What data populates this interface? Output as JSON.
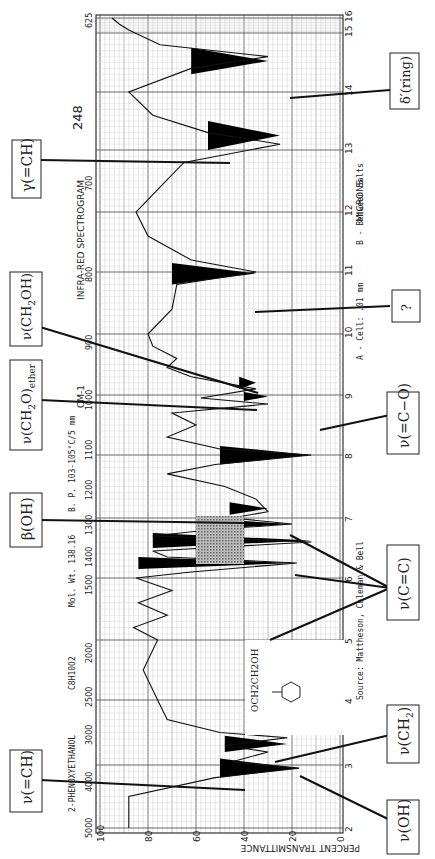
{
  "chart_data": {
    "type": "line",
    "title": "INFRA-RED SPECTROGRAM",
    "page_number": "248",
    "compound": "2-PHENOXYETHANOL",
    "formula": "C8H10O2",
    "mol_wt": "Mol. Wt. 138.16",
    "bp": "B. P. 103-105°C/5 mm",
    "cell": "A - Cell: .01 mm",
    "cell_b": "B - Between Salts",
    "source": "Source: Mattheson, Coleman & Bell",
    "structure_label": "OCH2CH2OH",
    "xlabel_top": "CM-1",
    "xlabel_bottom": "MICRONS",
    "ylabel": "PERCENT TRANSMITTANCE",
    "orientation": "rotated 90° counter-clockwise",
    "wavenumber_ticks": [
      "5000",
      "4000",
      "3000",
      "2500",
      "2000",
      "1500",
      "1400",
      "1300",
      "1200",
      "1100",
      "1000",
      "900",
      "800",
      "700",
      "625"
    ],
    "micron_ticks": [
      "2",
      "3",
      "4",
      "5",
      "6",
      "7",
      "8",
      "9",
      "10",
      "11",
      "12",
      "13",
      "14",
      "15",
      "16"
    ],
    "transmittance_ticks": [
      "100",
      "80",
      "60",
      "40",
      "20",
      "0"
    ],
    "ylim": [
      0,
      100
    ],
    "xlim_cm1": [
      5000,
      625
    ],
    "series": [
      {
        "name": "2-phenoxyethanol spectrum",
        "x_micron": [
          2.0,
          2.5,
          2.8,
          2.95,
          3.05,
          3.2,
          3.3,
          3.42,
          3.5,
          3.7,
          4.0,
          4.5,
          5.0,
          5.2,
          5.4,
          5.6,
          5.8,
          6.0,
          6.1,
          6.25,
          6.35,
          6.45,
          6.6,
          6.7,
          6.8,
          6.9,
          7.0,
          7.1,
          7.3,
          7.5,
          7.7,
          7.85,
          8.0,
          8.1,
          8.3,
          8.5,
          8.7,
          8.85,
          8.95,
          9.1,
          9.3,
          9.45,
          9.6,
          9.8,
          10.0,
          10.4,
          10.8,
          11.0,
          11.2,
          11.6,
          12.0,
          12.4,
          12.8,
          13.1,
          13.3,
          13.6,
          14.0,
          14.4,
          14.6,
          14.8,
          15.2,
          15.6,
          16.0
        ],
        "transmittance": [
          88,
          88,
          52,
          17,
          45,
          30,
          48,
          22,
          50,
          72,
          76,
          82,
          76,
          86,
          72,
          84,
          70,
          85,
          62,
          18,
          72,
          78,
          12,
          78,
          55,
          20,
          45,
          30,
          35,
          48,
          72,
          52,
          12,
          50,
          72,
          60,
          70,
          30,
          58,
          35,
          62,
          72,
          68,
          78,
          80,
          70,
          68,
          35,
          62,
          80,
          85,
          75,
          65,
          25,
          55,
          78,
          88,
          62,
          30,
          75,
          88,
          92,
          95
        ]
      }
    ],
    "annotations": [
      {
        "label": "ν(OH)",
        "wavenumber": 3330,
        "micron": 3.0
      },
      {
        "label": "ν(=CH)",
        "wavenumber": 3060,
        "micron": 3.27
      },
      {
        "label": "ν(CH2)",
        "wavenumber": 2930,
        "micron": 3.42
      },
      {
        "label": "ν(C=C)",
        "wavenumber": 1600,
        "micron": 6.25
      },
      {
        "label": "ν(C=C)",
        "wavenumber": 1500,
        "micron": 6.67
      },
      {
        "label": "ν(C=C)",
        "wavenumber": 1460,
        "micron": 6.85
      },
      {
        "label": "β(OH)",
        "wavenumber": 1400,
        "micron": 7.14
      },
      {
        "label": "ν(=C−O)",
        "wavenumber": 1245,
        "micron": 8.03
      },
      {
        "label": "ν(CH2O)ether",
        "wavenumber": 1100,
        "micron": 9.1
      },
      {
        "label": "ν(CH2OH)",
        "wavenumber": 1060,
        "micron": 9.43
      },
      {
        "label": "?",
        "wavenumber": 910,
        "micron": 11.0
      },
      {
        "label": "γ(=CH)",
        "wavenumber": 755,
        "micron": 13.25
      },
      {
        "label": "δ'(ring)",
        "wavenumber": 690,
        "micron": 14.5
      }
    ],
    "grid": true
  },
  "labels": {
    "oh": "ν(OH)",
    "eqch": "ν(=CH)",
    "ch2": "ν(CH",
    "ch2_sub": "2",
    "ch2_close": ")",
    "cc": "ν(C=C)",
    "boh": "β(OH)",
    "eqco": "ν(=C−O)",
    "ether": "ν(CH",
    "ether_sub": "2",
    "ether_mid": "O)",
    "ether_sub2": "ether",
    "ch2oh": "ν(CH",
    "ch2oh_sub": "2",
    "ch2oh_end": "OH)",
    "unknown": "?",
    "geqch": "γ(=CH)",
    "ring": "δ′(ring)"
  }
}
